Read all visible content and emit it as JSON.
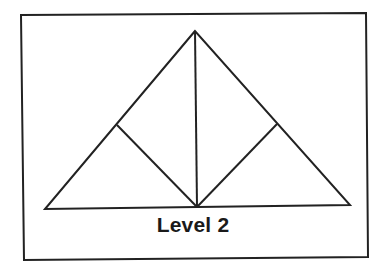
{
  "diagram": {
    "caption": "Level 2",
    "stroke_color": "#222222",
    "frame": {
      "points": [
        [
          21,
          15
        ],
        [
          366,
          13
        ],
        [
          368,
          257
        ],
        [
          24,
          260
        ]
      ]
    },
    "outer_triangle": {
      "apex": [
        195,
        31
      ],
      "base_left": [
        45,
        209
      ],
      "base_right": [
        350,
        205
      ]
    },
    "lines": [
      {
        "name": "center-altitude",
        "from": [
          195,
          31
        ],
        "to": [
          197,
          207
        ]
      },
      {
        "name": "left-subdivision",
        "from": [
          117,
          125
        ],
        "to": [
          197,
          207
        ]
      },
      {
        "name": "right-subdivision",
        "from": [
          277,
          124
        ],
        "to": [
          197,
          207
        ]
      }
    ]
  }
}
